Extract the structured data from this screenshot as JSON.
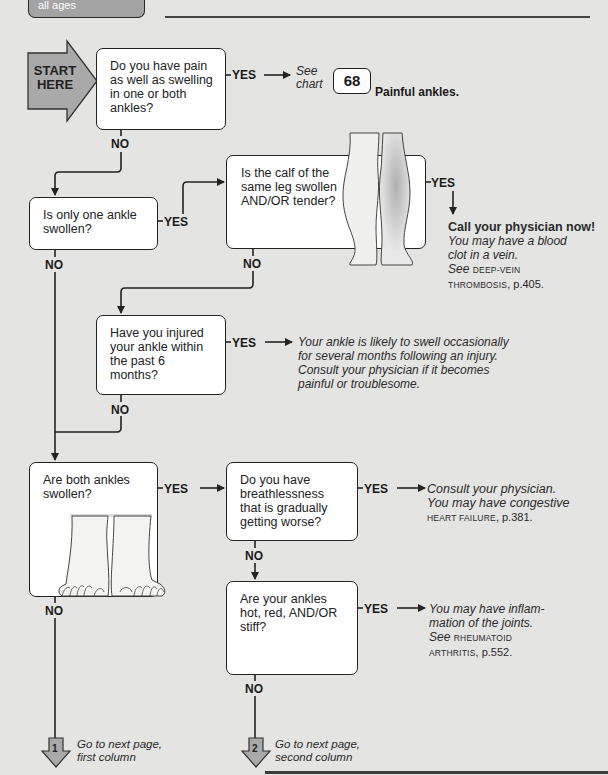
{
  "header": {
    "tab_label": "all ages"
  },
  "start": {
    "label_line1": "START",
    "label_line2": "HERE",
    "fill_color": "#a9a9a9"
  },
  "labels": {
    "yes": "YES",
    "no": "NO"
  },
  "questions": [
    {
      "id": "q1",
      "text": "Do you have pain as well as swelling in one or both ankles?"
    },
    {
      "id": "q2",
      "text": "Is only one ankle swollen?"
    },
    {
      "id": "q3",
      "text": "Is the calf of the same leg swollen AND/OR tender?"
    },
    {
      "id": "q4",
      "text": "Have you injured your ankle within the past 6 months?"
    },
    {
      "id": "q5",
      "text": "Are both ankles swollen?"
    },
    {
      "id": "q6",
      "text": "Do you have breathlessness that is gradually getting worse?"
    },
    {
      "id": "q7",
      "text": "Are your ankles hot, red, AND/OR stiff?"
    }
  ],
  "outcomes": {
    "q1_yes": {
      "see": "See",
      "chart": "chart",
      "chart_number": "68",
      "chart_title": "Painful ankles."
    },
    "q3_yes": {
      "headline": "Call your physician now!",
      "line1": "You may have a blood",
      "line2": "clot in a vein.",
      "see": "See",
      "ref1": "DEEP-VEIN",
      "ref2": "THROMBOSIS",
      "page": ", p.405."
    },
    "q4_yes": {
      "line1": "Your ankle is likely to swell occasionally",
      "line2": "for several months following an injury.",
      "line3": "Consult your physician if it becomes",
      "line4": "painful or troublesome."
    },
    "q6_yes": {
      "line1": "Consult your physician.",
      "line2": "You may have congestive",
      "ref": "HEART FAILURE",
      "page": ", p.381."
    },
    "q7_yes": {
      "line1": "You may have inflam-",
      "line2": "mation of the joints.",
      "see": "See",
      "ref1": "RHEUMATOID",
      "ref2": "ARTHRITIS",
      "page": ", p.552."
    }
  },
  "continuations": [
    {
      "number": "1",
      "line1": "Go to next page,",
      "line2": "first column"
    },
    {
      "number": "2",
      "line1": "Go to next page,",
      "line2": "second column"
    }
  ]
}
